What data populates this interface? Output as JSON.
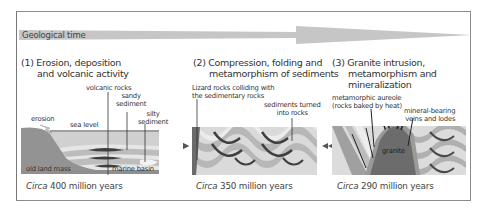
{
  "timeline": {
    "label": "Geological time",
    "color": "#c4c4c4"
  },
  "panels": [
    {
      "id": "stage-1",
      "title_line1": "(1) Erosion, deposition",
      "title_line2": "and volcanic activity",
      "labels": {
        "volcanic_rocks": "volcanic rocks",
        "sandy_sediment_1": "sandy",
        "sandy_sediment_2": "sediment",
        "silty_sediment_1": "silty",
        "silty_sediment_2": "sediment",
        "erosion": "erosion",
        "sea_level": "sea level",
        "old_land_mass": "old land mass",
        "marine_basin": "marine basin"
      },
      "caption_italic": "Circa",
      "caption_rest": " 400 million years"
    },
    {
      "id": "stage-2",
      "title_line1": "(2) Compression, folding and",
      "title_line2": "metamorphism of sediments",
      "labels": {
        "lizard_rocks_1": "Lizard rocks colliding with",
        "lizard_rocks_2": "the sedimentary rocks",
        "sediments_turned_1": "sediments turned",
        "sediments_turned_2": "into rocks"
      },
      "caption_italic": "Circa",
      "caption_rest": " 350 million years"
    },
    {
      "id": "stage-3",
      "title_line1": "(3) Granite intrusion,",
      "title_line2": "metamorphism and",
      "title_line3": "mineralization",
      "labels": {
        "aureole_1": "metamorphic aureole",
        "aureole_2": "(rocks baked by heat)",
        "veins_1": "mineral-bearing",
        "veins_2": "veins and lodes",
        "granite": "granite"
      },
      "caption_italic": "Circa",
      "caption_rest": " 290 million years"
    }
  ],
  "colors": {
    "frame": "#8c8c8c",
    "land_dark": "#8f8f8f",
    "land_mid": "#a9a9a9",
    "sediment_light": "#d9d9d9",
    "sediment_pale": "#ececec",
    "band_dark": "#4a4a4a",
    "granite": "#6e6e6e",
    "arrow": "#555555"
  }
}
